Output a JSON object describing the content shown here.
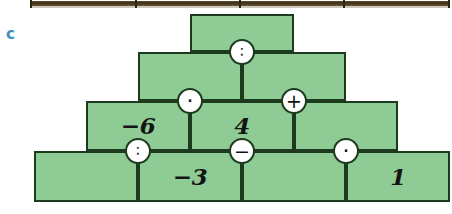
{
  "exercise": {
    "label": "c"
  },
  "colors": {
    "block_fill": "#8fcb94",
    "block_border": "#1d3a1f",
    "circle_fill": "#ffffff",
    "label_blue": "#3c8fc4",
    "strip_brown": "#3a2f18",
    "text_black": "#141414"
  },
  "pyramid": {
    "type": "number-pyramid",
    "rows": 4,
    "rows_data": [
      {
        "row": 1,
        "cells": [
          {
            "index": 0,
            "value": ""
          }
        ]
      },
      {
        "row": 2,
        "cells": [
          {
            "index": 0,
            "value": ""
          },
          {
            "index": 1,
            "value": ""
          }
        ]
      },
      {
        "row": 3,
        "cells": [
          {
            "index": 0,
            "value": "−6"
          },
          {
            "index": 1,
            "value": "4"
          },
          {
            "index": 2,
            "value": ""
          }
        ]
      },
      {
        "row": 4,
        "cells": [
          {
            "index": 0,
            "value": ""
          },
          {
            "index": 1,
            "value": "−3"
          },
          {
            "index": 2,
            "value": ""
          },
          {
            "index": 3,
            "value": "1"
          }
        ]
      }
    ],
    "operators": [
      {
        "id": "op-r1-r2",
        "symbol": "∶",
        "name": "divide",
        "between_row": "2",
        "position": "center"
      },
      {
        "id": "op-r2-r3-a",
        "symbol": "·",
        "name": "multiply",
        "between_row": "3",
        "position": "left"
      },
      {
        "id": "op-r2-r3-b",
        "symbol": "+",
        "name": "plus",
        "between_row": "3",
        "position": "right"
      },
      {
        "id": "op-r3-r4-a",
        "symbol": "∶",
        "name": "divide",
        "between_row": "4",
        "position": "left"
      },
      {
        "id": "op-r3-r4-b",
        "symbol": "−",
        "name": "minus",
        "between_row": "4",
        "position": "center"
      },
      {
        "id": "op-r3-r4-c",
        "symbol": "·",
        "name": "multiply",
        "between_row": "4",
        "position": "right"
      }
    ]
  }
}
